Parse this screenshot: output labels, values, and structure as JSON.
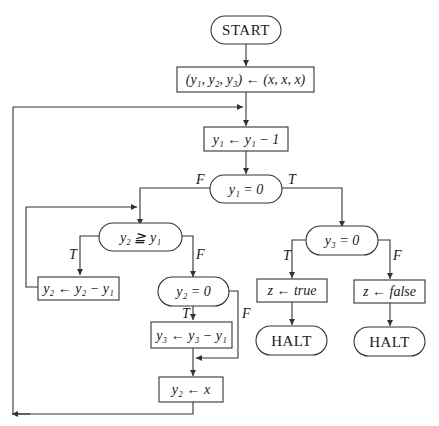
{
  "diagram": {
    "type": "flowchart",
    "nodes": {
      "start": {
        "kind": "terminal",
        "label": "START"
      },
      "init": {
        "kind": "process",
        "label": "(y₁, y₂, y₃) ← (x, x, x)"
      },
      "dec_y1": {
        "kind": "process",
        "label": "y₁ ← y₁ − 1"
      },
      "test_y1_zero": {
        "kind": "decision",
        "label": "y₁ = 0"
      },
      "test_y2_ge_y1": {
        "kind": "decision",
        "label": "y₂ ≧ y₁"
      },
      "sub_y2": {
        "kind": "process",
        "label": "y₂ ← y₂ − y₁"
      },
      "test_y2_zero": {
        "kind": "decision",
        "label": "y₂ = 0"
      },
      "sub_y3": {
        "kind": "process",
        "label": "y₃ ← y₃ − y₁"
      },
      "reset_y2": {
        "kind": "process",
        "label": "y₂ ← x"
      },
      "test_y3_zero": {
        "kind": "decision",
        "label": "y₃ = 0"
      },
      "set_true": {
        "kind": "process",
        "label_prefix": "z ← ",
        "label_value": "true"
      },
      "set_false": {
        "kind": "process",
        "label_prefix": "z ← ",
        "label_value": "false"
      },
      "halt_true": {
        "kind": "terminal",
        "label": "HALT"
      },
      "halt_false": {
        "kind": "terminal",
        "label": "HALT"
      }
    },
    "edge_labels": {
      "y1_zero_false": "F",
      "y1_zero_true": "T",
      "y2_ge_true": "T",
      "y2_ge_false": "F",
      "y2_zero_true": "T",
      "y2_zero_false": "F",
      "y3_zero_true": "T",
      "y3_zero_false": "F"
    },
    "edges": [
      {
        "from": "start",
        "to": "init"
      },
      {
        "from": "init",
        "to": "dec_y1"
      },
      {
        "from": "dec_y1",
        "to": "test_y1_zero"
      },
      {
        "from": "test_y1_zero",
        "to": "test_y2_ge_y1",
        "label": "F"
      },
      {
        "from": "test_y1_zero",
        "to": "test_y3_zero",
        "label": "T"
      },
      {
        "from": "test_y2_ge_y1",
        "to": "sub_y2",
        "label": "T"
      },
      {
        "from": "sub_y2",
        "to": "test_y2_ge_y1"
      },
      {
        "from": "test_y2_ge_y1",
        "to": "test_y2_zero",
        "label": "F"
      },
      {
        "from": "test_y2_zero",
        "to": "sub_y3",
        "label": "T"
      },
      {
        "from": "test_y2_zero",
        "to": "reset_y2",
        "label": "F"
      },
      {
        "from": "sub_y3",
        "to": "reset_y2"
      },
      {
        "from": "reset_y2",
        "to": "dec_y1"
      },
      {
        "from": "test_y3_zero",
        "to": "set_true",
        "label": "T"
      },
      {
        "from": "test_y3_zero",
        "to": "set_false",
        "label": "F"
      },
      {
        "from": "set_true",
        "to": "halt_true"
      },
      {
        "from": "set_false",
        "to": "halt_false"
      }
    ]
  }
}
